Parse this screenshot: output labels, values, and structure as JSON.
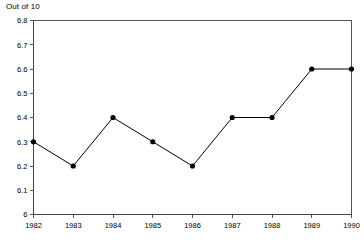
{
  "chart_data": {
    "type": "line",
    "title": "Out of 10",
    "xlabel": "",
    "ylabel": "",
    "categories": [
      "1982",
      "1983",
      "1984",
      "1985",
      "1986",
      "1987",
      "1988",
      "1989",
      "1990"
    ],
    "x": [
      1982,
      1983,
      1984,
      1985,
      1986,
      1987,
      1988,
      1989,
      1990
    ],
    "values": [
      6.3,
      6.2,
      6.4,
      6.3,
      6.2,
      6.4,
      6.4,
      6.6,
      6.6
    ],
    "series": [
      {
        "name": "Out of 10",
        "values": [
          6.3,
          6.2,
          6.4,
          6.3,
          6.2,
          6.4,
          6.4,
          6.6,
          6.6
        ]
      }
    ],
    "ylim": [
      6.0,
      6.8
    ],
    "yticks": [
      6.0,
      6.1,
      6.2,
      6.3,
      6.4,
      6.5,
      6.6,
      6.7,
      6.8
    ],
    "ytick_labels": [
      "6",
      "6.1",
      "6.2",
      "6.3",
      "6.4",
      "6.5",
      "6.6",
      "6.7",
      "6.8"
    ],
    "xtick_labels": [
      "1982",
      "1983",
      "1984",
      "1985",
      "1986",
      "1987",
      "1988",
      "1989",
      "1990"
    ],
    "grid": false,
    "legend": false,
    "legend_position": "none",
    "marker": "filled-circle",
    "line_color": "#000000",
    "marker_color": "#000000",
    "axis_color": "#555555",
    "background_color": "#ffffff"
  }
}
